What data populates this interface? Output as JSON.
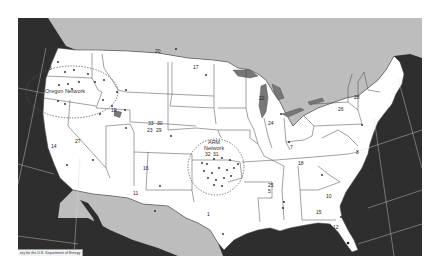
{
  "map": {
    "subject": "Solar radiation monitoring sites, contiguous United States",
    "colors": {
      "ocean": "#2e2e2e",
      "foreign_land": "#bdbdbd",
      "us_land": "#ffffff",
      "borders": "#444444",
      "graticule": "#d8d8d8",
      "network_circle": "#555555"
    },
    "networks": [
      {
        "id": "uo",
        "label": "U. Oregon Network"
      },
      {
        "id": "arm",
        "label_line1": "ARM",
        "label_line2": "Network"
      }
    ],
    "sites": [
      {
        "label": "21",
        "x": 57,
        "y": 41
      },
      {
        "label": "13",
        "x": 46,
        "y": 66
      },
      {
        "label": "20",
        "x": 155,
        "y": 49
      },
      {
        "label": "17",
        "x": 193,
        "y": 65
      },
      {
        "label": "19",
        "x": 111,
        "y": 108
      },
      {
        "label": "33",
        "x": 148,
        "y": 121
      },
      {
        "label": "30",
        "x": 157,
        "y": 121
      },
      {
        "label": "23",
        "x": 147,
        "y": 128
      },
      {
        "label": "29",
        "x": 156,
        "y": 128
      },
      {
        "label": "27",
        "x": 75,
        "y": 139
      },
      {
        "label": "14",
        "x": 51,
        "y": 144
      },
      {
        "label": "16",
        "x": 143,
        "y": 166
      },
      {
        "label": "11",
        "x": 133,
        "y": 191
      },
      {
        "label": "1",
        "x": 207,
        "y": 212
      },
      {
        "label": "32",
        "x": 205,
        "y": 152
      },
      {
        "label": "31",
        "x": 213,
        "y": 152
      },
      {
        "label": "22",
        "x": 259,
        "y": 96
      },
      {
        "label": "24",
        "x": 268,
        "y": 121
      },
      {
        "label": "7",
        "x": 290,
        "y": 145
      },
      {
        "label": "18",
        "x": 298,
        "y": 161
      },
      {
        "label": "25",
        "x": 268,
        "y": 183
      },
      {
        "label": "5",
        "x": 268,
        "y": 189
      },
      {
        "label": "10",
        "x": 326,
        "y": 194
      },
      {
        "label": "15",
        "x": 316,
        "y": 210
      },
      {
        "label": "12",
        "x": 333,
        "y": 225
      },
      {
        "label": "26",
        "x": 338,
        "y": 107
      },
      {
        "label": "28",
        "x": 354,
        "y": 95
      },
      {
        "label": "8",
        "x": 356,
        "y": 150
      }
    ],
    "credit": "ory for the U.S. Department of Energy"
  }
}
